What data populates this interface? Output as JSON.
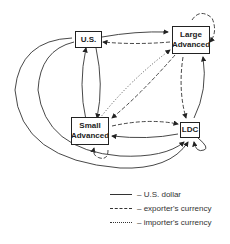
{
  "diagram": {
    "nodes": {
      "us": {
        "label": "U.S."
      },
      "large": {
        "label_line1": "Large",
        "label_line2": "Advanced"
      },
      "small": {
        "label_line1": "Small",
        "label_line2": "Advanced"
      },
      "ldc": {
        "label": "LDC"
      }
    },
    "legend": [
      {
        "style": "solid",
        "label": "– U.S. dollar"
      },
      {
        "style": "dashed",
        "label": "– exporter's currency"
      },
      {
        "style": "dotted",
        "label": "– importer's currency"
      }
    ]
  }
}
